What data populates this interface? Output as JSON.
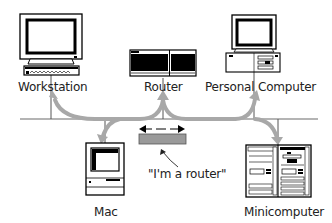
{
  "diagram": {
    "type": "network-topology",
    "nodes": [
      {
        "id": "workstation",
        "label": "Workstation",
        "icon": "workstation-icon"
      },
      {
        "id": "router",
        "label": "Router",
        "icon": "router-icon"
      },
      {
        "id": "personal_computer",
        "label": "Personal Computer",
        "icon": "personal-computer-icon"
      },
      {
        "id": "mac",
        "label": "Mac",
        "icon": "mac-icon"
      },
      {
        "id": "minicomputer",
        "label": "Minicomputer",
        "icon": "minicomputer-icon"
      }
    ],
    "annotation": {
      "text": "\"I'm a router\"",
      "points_to": "software-router-bar"
    },
    "colors": {
      "line": "#555555",
      "flow_arrow": "#a8a8a8",
      "router_bar": "#9a9a9a",
      "screen": "#000000"
    }
  }
}
